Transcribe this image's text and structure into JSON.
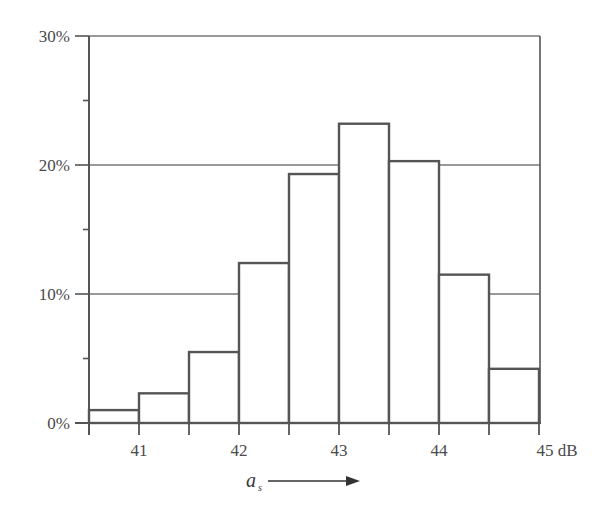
{
  "chart_data": {
    "type": "bar",
    "title": "",
    "xlabel": "a_s",
    "xlabel_main": "a",
    "xlabel_sub": "s",
    "ylabel": "",
    "x_unit": "dB",
    "bin_width": 0.5,
    "bin_edges": [
      40.5,
      41.0,
      41.5,
      42.0,
      42.5,
      43.0,
      43.5,
      44.0,
      44.5,
      45.0
    ],
    "categories": [
      "40.5–41.0",
      "41.0–41.5",
      "41.5–42.0",
      "42.0–42.5",
      "42.5–43.0",
      "43.0–43.5",
      "43.5–44.0",
      "44.0–44.5",
      "44.5–45.0"
    ],
    "values": [
      1.0,
      2.3,
      5.5,
      12.4,
      19.3,
      23.2,
      20.3,
      11.5,
      4.2
    ],
    "value_unit": "%",
    "xlim": [
      40.5,
      45.0
    ],
    "ylim": [
      0,
      30
    ],
    "x_ticks": [
      {
        "value": 41,
        "label": "41"
      },
      {
        "value": 42,
        "label": "42"
      },
      {
        "value": 43,
        "label": "43"
      },
      {
        "value": 44,
        "label": "44"
      },
      {
        "value": 45,
        "label": "45 dB"
      }
    ],
    "x_minor_ticks": [
      40.5,
      41.5,
      42.5,
      43.5,
      44.5
    ],
    "y_ticks": [
      {
        "value": 0,
        "label": "0%"
      },
      {
        "value": 10,
        "label": "10%"
      },
      {
        "value": 20,
        "label": "20%"
      },
      {
        "value": 30,
        "label": "30%"
      }
    ],
    "y_minor_ticks": [
      5,
      15,
      25
    ],
    "grid": {
      "horizontal": [
        10,
        20,
        30
      ],
      "vertical": false
    },
    "legend": null,
    "annotations": [
      {
        "text": "a_s →",
        "meaning": "arrow indicating increasing a_s along x-axis"
      }
    ]
  },
  "style": {
    "line_color": "#555555",
    "grid_color": "#777777",
    "bar_fill": "#ffffff",
    "bar_stroke": "#555555"
  }
}
